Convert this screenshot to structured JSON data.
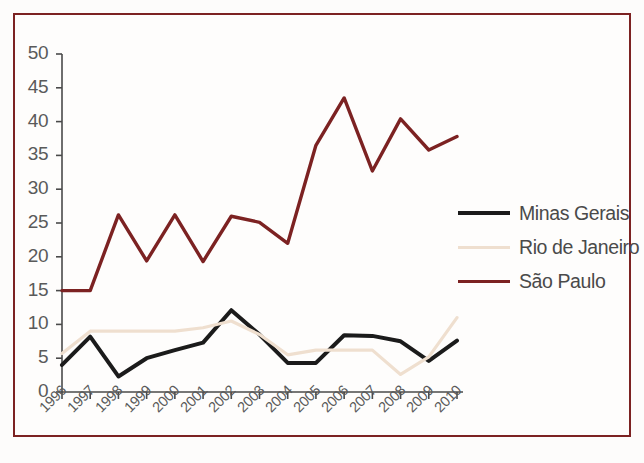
{
  "chart_data": {
    "type": "line",
    "title": "",
    "subtitle": "",
    "xlabel": "",
    "ylabel": "",
    "grid": false,
    "legend_position": "right",
    "categories": [
      "1996",
      "1997",
      "1998",
      "1999",
      "2000",
      "2001",
      "2002",
      "2003",
      "2004",
      "2005",
      "2006",
      "2007",
      "2008",
      "2009",
      "2010"
    ],
    "x": [
      1996,
      1997,
      1998,
      1999,
      2000,
      2001,
      2002,
      2003,
      2004,
      2005,
      2006,
      2007,
      2008,
      2009,
      2010
    ],
    "xlim": [
      1996,
      2010
    ],
    "ylim": [
      0,
      50
    ],
    "yticks": [
      0,
      5,
      10,
      15,
      20,
      25,
      30,
      35,
      40,
      45,
      50
    ],
    "ytick_labels": [
      "0",
      "5",
      "10",
      "15",
      "20",
      "25",
      "30",
      "35",
      "40",
      "45",
      "50"
    ],
    "series": [
      {
        "name": "Minas Gerais",
        "color": "#1b1b1b",
        "values": [
          4.0,
          8.2,
          2.3,
          5.0,
          6.2,
          7.3,
          12.1,
          8.5,
          4.3,
          4.3,
          8.4,
          8.3,
          7.5,
          4.6,
          7.6
        ]
      },
      {
        "name": "Rio de Janeiro",
        "color": "#efdfcf",
        "values": [
          5.7,
          9.0,
          9.0,
          9.0,
          9.0,
          9.5,
          10.5,
          8.5,
          5.5,
          6.2,
          6.2,
          6.2,
          2.6,
          5.2,
          11.0
        ]
      },
      {
        "name": "São Paulo",
        "color": "#7c2222",
        "values": [
          15.0,
          15.0,
          26.2,
          19.4,
          26.2,
          19.3,
          26.0,
          25.1,
          22.0,
          36.5,
          43.5,
          32.7,
          40.4,
          35.8,
          37.8
        ]
      }
    ]
  },
  "legend": {
    "items": [
      {
        "label": "Minas Gerais",
        "swatch": "s-thick"
      },
      {
        "label": "Rio de Janeiro",
        "swatch": "s-cream"
      },
      {
        "label": "São Paulo",
        "swatch": "s-red"
      }
    ]
  },
  "colors": {
    "frame": "#7c2222",
    "background": "#fefdfc",
    "axis": "#4a4a4a",
    "minas_gerais": "#1b1b1b",
    "rio_de_janeiro": "#efdfcf",
    "sao_paulo": "#7c2222"
  }
}
